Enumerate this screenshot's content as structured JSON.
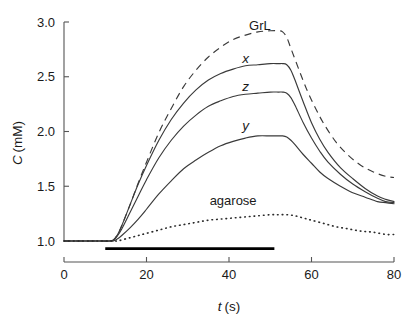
{
  "chart_data": {
    "type": "line",
    "title": "",
    "xlabel": "t (s)",
    "xlabel_italic": "t",
    "xlabel_unit": "(s)",
    "ylabel": "C (mM)",
    "ylabel_italic": "C",
    "ylabel_unit": "(mM)",
    "xlim": [
      0,
      80
    ],
    "ylim": [
      1.0,
      3.0
    ],
    "xticks": [
      0,
      20,
      40,
      60,
      80
    ],
    "xtick_labels": [
      "0",
      "20",
      "40",
      "60",
      "80"
    ],
    "yticks": [
      1.0,
      1.5,
      2.0,
      2.5,
      3.0
    ],
    "ytick_labels": [
      "1.0",
      "1.5",
      "2.0",
      "2.5",
      "3.0"
    ],
    "grid": false,
    "legend": "inline-curve-labels",
    "baseline_value": 1.0,
    "stimulus_bar": {
      "label": "stimulus-period-bar",
      "t_start": 10.0,
      "t_end": 51.0,
      "y_value": 0.93
    },
    "series": [
      {
        "name": "GrL",
        "label": "GrL",
        "style": "dashed",
        "label_x": 47.5,
        "label_y": 2.93,
        "x": [
          0,
          4,
          8,
          11,
          12,
          13,
          14,
          16,
          18,
          20,
          23,
          26,
          29,
          32,
          35,
          38,
          41,
          44,
          47,
          50,
          52,
          53,
          54,
          55,
          57,
          59,
          61,
          63,
          66,
          69,
          72,
          75,
          78,
          80
        ],
        "y": [
          1.0,
          1.0,
          1.0,
          1.0,
          1.01,
          1.06,
          1.14,
          1.33,
          1.53,
          1.72,
          1.99,
          2.21,
          2.41,
          2.56,
          2.68,
          2.77,
          2.84,
          2.88,
          2.91,
          2.92,
          2.92,
          2.91,
          2.86,
          2.76,
          2.56,
          2.37,
          2.21,
          2.07,
          1.9,
          1.78,
          1.69,
          1.63,
          1.59,
          1.58
        ]
      },
      {
        "name": "x",
        "label": "x",
        "style": "solid",
        "label_x": 44.0,
        "label_y": 2.63,
        "x": [
          0,
          4,
          8,
          11,
          12,
          13,
          14,
          16,
          18,
          20,
          23,
          26,
          29,
          32,
          35,
          38,
          41,
          44,
          47,
          50,
          52,
          53,
          54,
          55,
          56,
          58,
          60,
          62,
          64,
          67,
          70,
          73,
          76,
          78,
          80
        ],
        "y": [
          1.0,
          1.0,
          1.0,
          1.0,
          1.01,
          1.06,
          1.14,
          1.33,
          1.52,
          1.69,
          1.92,
          2.11,
          2.26,
          2.38,
          2.47,
          2.53,
          2.57,
          2.6,
          2.61,
          2.62,
          2.62,
          2.62,
          2.61,
          2.56,
          2.47,
          2.27,
          2.08,
          1.93,
          1.81,
          1.67,
          1.57,
          1.48,
          1.41,
          1.38,
          1.36
        ]
      },
      {
        "name": "z",
        "label": "z",
        "style": "solid",
        "label_x": 44.0,
        "label_y": 2.37,
        "x": [
          0,
          4,
          8,
          11,
          12,
          13,
          14,
          16,
          18,
          20,
          23,
          26,
          29,
          32,
          35,
          38,
          41,
          44,
          47,
          50,
          52,
          53,
          54,
          55,
          56,
          58,
          60,
          62,
          64,
          67,
          70,
          73,
          76,
          78,
          80
        ],
        "y": [
          1.0,
          1.0,
          1.0,
          1.0,
          1.01,
          1.05,
          1.11,
          1.26,
          1.41,
          1.56,
          1.76,
          1.92,
          2.05,
          2.15,
          2.23,
          2.28,
          2.32,
          2.34,
          2.35,
          2.36,
          2.36,
          2.36,
          2.35,
          2.31,
          2.24,
          2.08,
          1.94,
          1.82,
          1.72,
          1.61,
          1.52,
          1.45,
          1.39,
          1.36,
          1.35
        ]
      },
      {
        "name": "y",
        "label": "y",
        "style": "solid",
        "label_x": 44.0,
        "label_y": 2.01,
        "x": [
          0,
          4,
          8,
          11,
          12,
          13,
          14,
          16,
          18,
          20,
          23,
          26,
          29,
          32,
          35,
          38,
          41,
          44,
          47,
          50,
          52,
          53,
          54,
          55,
          56,
          58,
          60,
          62,
          64,
          67,
          70,
          73,
          76,
          78,
          80
        ],
        "y": [
          1.0,
          1.0,
          1.0,
          1.0,
          1.0,
          1.02,
          1.05,
          1.12,
          1.2,
          1.29,
          1.43,
          1.55,
          1.66,
          1.74,
          1.81,
          1.87,
          1.91,
          1.94,
          1.96,
          1.96,
          1.96,
          1.96,
          1.95,
          1.92,
          1.88,
          1.79,
          1.71,
          1.63,
          1.57,
          1.5,
          1.44,
          1.4,
          1.36,
          1.35,
          1.34
        ]
      },
      {
        "name": "agarose",
        "label": "agarose",
        "style": "dotted",
        "label_x": 41.0,
        "label_y": 1.33,
        "x": [
          0,
          4,
          8,
          11,
          12,
          13,
          14,
          16,
          18,
          20,
          23,
          26,
          29,
          32,
          35,
          38,
          41,
          44,
          47,
          50,
          52,
          54,
          56,
          58,
          60,
          63,
          66,
          69,
          72,
          75,
          78,
          80
        ],
        "y": [
          1.0,
          1.0,
          1.0,
          1.0,
          1.0,
          1.0,
          1.01,
          1.03,
          1.05,
          1.07,
          1.1,
          1.13,
          1.15,
          1.17,
          1.19,
          1.2,
          1.21,
          1.22,
          1.23,
          1.24,
          1.24,
          1.24,
          1.23,
          1.21,
          1.19,
          1.16,
          1.13,
          1.11,
          1.09,
          1.08,
          1.06,
          1.06
        ]
      }
    ]
  },
  "colors": {
    "background": "#ffffff",
    "axis": "#555555",
    "curve": "#3a3a3a",
    "bar": "#000000",
    "text": "#1a1a1a"
  }
}
